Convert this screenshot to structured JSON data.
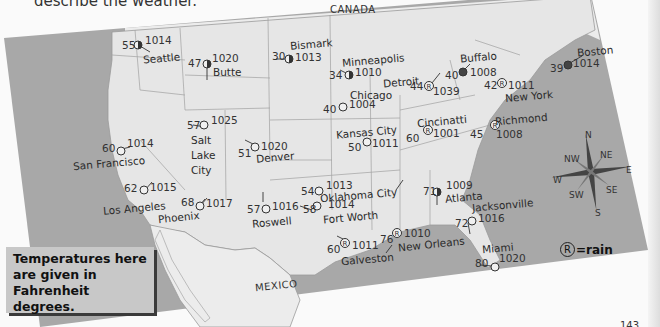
{
  "page": {
    "header_fragment": "describe the weather.",
    "page_number": "143"
  },
  "map": {
    "type": "weather-map",
    "region": "United States",
    "countries": {
      "canada": "CANADA",
      "mexico": "MEXICO"
    },
    "colors": {
      "land": "#e6e6e6",
      "foreign_land": "#ececec",
      "water": "#a8a8a8",
      "borders": "#9a9a9a",
      "text": "#2b2b2b"
    },
    "stations": [
      {
        "city": "Seattle",
        "temp": "55",
        "pressure": "1014",
        "sky": "partly-cloudy"
      },
      {
        "city": "Butte",
        "temp": "47",
        "pressure": "1020",
        "sky": "partly-cloudy"
      },
      {
        "city": "Bismark",
        "temp": "30",
        "pressure": "1013",
        "sky": "partly-cloudy"
      },
      {
        "city": "Minneapolis",
        "temp": "34",
        "pressure": "1010",
        "sky": "partly-cloudy"
      },
      {
        "city": "Buffalo",
        "temp": "40",
        "pressure": "1008",
        "sky": "overcast"
      },
      {
        "city": "Boston",
        "temp": "39",
        "pressure": "1014",
        "sky": "overcast"
      },
      {
        "city": "Detroit",
        "temp": "44",
        "pressure": "1039",
        "sky": "rain"
      },
      {
        "city": "Chicago",
        "temp": "40",
        "pressure": "1004",
        "sky": "clear"
      },
      {
        "city": "New York",
        "temp": "42",
        "pressure": "1011",
        "sky": "rain"
      },
      {
        "city": "Salt Lake City",
        "temp": "57",
        "pressure": "1025",
        "sky": "clear"
      },
      {
        "city": "San Francisco",
        "temp": "60",
        "pressure": "1014",
        "sky": "clear"
      },
      {
        "city": "Denver",
        "temp": "51",
        "pressure": "1020",
        "sky": "clear"
      },
      {
        "city": "Kansas City",
        "temp": "50",
        "pressure": "1011",
        "sky": "clear"
      },
      {
        "city": "Cincinatti",
        "temp": "60",
        "pressure": "1001",
        "sky": "rain"
      },
      {
        "city": "Richmond",
        "temp": "45",
        "pressure": "1008",
        "sky": "rain"
      },
      {
        "city": "Los Angeles",
        "temp": "62",
        "pressure": "1015",
        "sky": "clear"
      },
      {
        "city": "Phoenix",
        "temp": "68",
        "pressure": "1017",
        "sky": "clear"
      },
      {
        "city": "Oklahoma City",
        "temp": "54",
        "pressure": "1013",
        "sky": "clear"
      },
      {
        "city": "Atlanta",
        "temp": "71",
        "pressure": "1009",
        "sky": "partly-cloudy"
      },
      {
        "city": "Roswell",
        "temp": "57",
        "pressure": "1016",
        "sky": "clear"
      },
      {
        "city": "Fort Worth",
        "temp": "58",
        "pressure": "1014",
        "sky": "clear"
      },
      {
        "city": "Jacksonville",
        "temp": "72",
        "pressure": "1016",
        "sky": "clear"
      },
      {
        "city": "Galveston",
        "temp": "60",
        "pressure": "1011",
        "sky": "rain"
      },
      {
        "city": "New Orleans",
        "temp": "76",
        "pressure": "1010",
        "sky": "rain"
      },
      {
        "city": "Miami",
        "temp": "80",
        "pressure": "1020",
        "sky": "clear"
      }
    ],
    "compass": {
      "n": "N",
      "ne": "NE",
      "e": "E",
      "se": "SE",
      "s": "S",
      "sw": "SW",
      "w": "W",
      "nw": "NW"
    },
    "legend": {
      "rain_symbol": "R",
      "rain_text": "=rain"
    },
    "note": "Temperatures here are given in Fahrenheit degrees."
  }
}
